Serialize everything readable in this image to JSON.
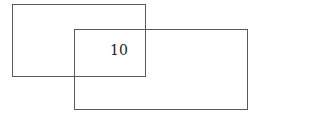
{
  "diagram": {
    "type": "overlapping-rectangles",
    "shapes": [
      {
        "id": "rect-a",
        "label": ""
      },
      {
        "id": "rect-b",
        "label": ""
      }
    ],
    "intersection_label": "10"
  }
}
